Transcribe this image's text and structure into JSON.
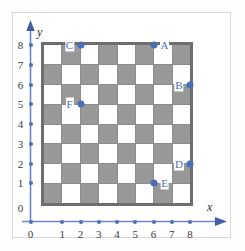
{
  "figure": {
    "type": "checkerboard-coordinate-grid",
    "axis_x_name": "x",
    "axis_y_name": "y",
    "x_ticks": [
      "0",
      "1",
      "2",
      "3",
      "4",
      "5",
      "6",
      "7",
      "8"
    ],
    "y_ticks": [
      "0",
      "1",
      "2",
      "3",
      "4",
      "5",
      "6",
      "7",
      "8"
    ],
    "accent_color": "#4a6fb5",
    "dark_square_color": "#989898",
    "light_square_color": "#ffffff",
    "board_border_color": "#6e6e6e",
    "board_columns": 8,
    "board_rows": 8,
    "board_top_left_square": "light"
  },
  "points": [
    {
      "label": "A",
      "x": 6,
      "y": 8,
      "label_side": "right"
    },
    {
      "label": "B",
      "x": 8,
      "y": 6,
      "label_side": "left"
    },
    {
      "label": "C",
      "x": 2,
      "y": 8,
      "label_side": "left"
    },
    {
      "label": "D",
      "x": 8,
      "y": 2,
      "label_side": "left"
    },
    {
      "label": "E",
      "x": 6,
      "y": 1,
      "label_side": "right"
    },
    {
      "label": "F",
      "x": 2,
      "y": 5,
      "label_side": "left"
    }
  ],
  "chart_data": {
    "type": "scatter",
    "title": "",
    "xlabel": "x",
    "ylabel": "y",
    "xlim": [
      0,
      8
    ],
    "ylim": [
      0,
      8
    ],
    "grid": true,
    "legend": "none",
    "categories": [
      "A",
      "B",
      "C",
      "D",
      "E",
      "F"
    ],
    "series": [
      {
        "name": "points",
        "points": [
          {
            "name": "A",
            "x": 6,
            "y": 8
          },
          {
            "name": "B",
            "x": 8,
            "y": 6
          },
          {
            "name": "C",
            "x": 2,
            "y": 8
          },
          {
            "name": "D",
            "x": 8,
            "y": 2
          },
          {
            "name": "E",
            "x": 6,
            "y": 1
          },
          {
            "name": "F",
            "x": 2,
            "y": 5
          }
        ]
      }
    ],
    "xticks": [
      0,
      1,
      2,
      3,
      4,
      5,
      6,
      7,
      8
    ],
    "yticks": [
      0,
      1,
      2,
      3,
      4,
      5,
      6,
      7,
      8
    ],
    "annotations": [
      "8x8 checkerboard overlaid on first-quadrant coordinate axes",
      "Each board square spans one unit in x and one unit in y"
    ]
  }
}
